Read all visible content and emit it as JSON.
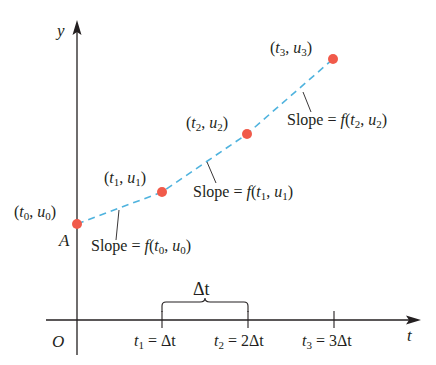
{
  "diagram": {
    "axes": {
      "y_label": "y",
      "t_label": "t",
      "origin_label": "O",
      "initial_point_label": "A"
    },
    "points": [
      {
        "label_t": "t",
        "sub_t": "0",
        "label_u": "u",
        "sub_u": "0",
        "x": 77,
        "y": 224
      },
      {
        "label_t": "t",
        "sub_t": "1",
        "label_u": "u",
        "sub_u": "1",
        "x": 162,
        "y": 192
      },
      {
        "label_t": "t",
        "sub_t": "2",
        "label_u": "u",
        "sub_u": "2",
        "x": 247,
        "y": 134
      },
      {
        "label_t": "t",
        "sub_t": "3",
        "label_u": "u",
        "sub_u": "3",
        "x": 333,
        "y": 59
      }
    ],
    "slopes": [
      {
        "prefix": "Slope = ",
        "f": "f",
        "t": "t",
        "sub_t": "0",
        "u": "u",
        "sub_u": "0"
      },
      {
        "prefix": "Slope = ",
        "f": "f",
        "t": "t",
        "sub_t": "1",
        "u": "u",
        "sub_u": "1"
      },
      {
        "prefix": "Slope = ",
        "f": "f",
        "t": "t",
        "sub_t": "2",
        "u": "u",
        "sub_u": "2"
      }
    ],
    "ticks": [
      {
        "var": "t",
        "sub": "1",
        "eq": " = ",
        "value": "Δt"
      },
      {
        "var": "t",
        "sub": "2",
        "eq": " = ",
        "value": "2Δt"
      },
      {
        "var": "t",
        "sub": "3",
        "eq": " = ",
        "value": "3Δt"
      }
    ],
    "brace_label": "Δt",
    "colors": {
      "points": "#f15a4a",
      "dashed_line": "#4fb3de",
      "axes": "#231f20"
    }
  }
}
